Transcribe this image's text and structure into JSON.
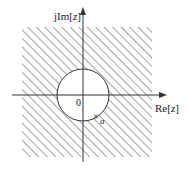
{
  "diagram": {
    "type": "z-plane region of convergence",
    "y_axis_label_prefix": "jIm[",
    "y_axis_label_var": "z",
    "y_axis_label_suffix": "]",
    "x_axis_label_prefix": "Re[",
    "x_axis_label_var": "z",
    "x_axis_label_suffix": "]",
    "origin_label": "0",
    "pole_marker": "×",
    "pole_label": "a",
    "region": "exterior of circle |z| > |a| (hatched)",
    "colors": {
      "line": "#333333",
      "hatch": "#555555",
      "background": "#ffffff"
    }
  }
}
